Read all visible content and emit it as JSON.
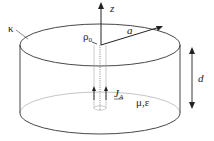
{
  "figure": {
    "type": "cylindrical cavity diagram",
    "labels": {
      "kappa": "κ",
      "rho0": "ρ",
      "rho0_sub": "0",
      "z": "z",
      "a": "a",
      "d": "d",
      "J": "J",
      "J_sub": "A",
      "medium": "μ,ε"
    },
    "colors": {
      "outline": "#333333",
      "inner": "#9a9a9a",
      "text": "#222222"
    }
  }
}
